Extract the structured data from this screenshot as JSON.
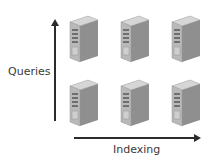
{
  "axes": {
    "y_label": "Queries",
    "x_label": "Indexing"
  },
  "servers": {
    "rows": 2,
    "columns": 3,
    "icon": "server-tower-icon",
    "positions": [
      {
        "x": 68,
        "y": 12
      },
      {
        "x": 119,
        "y": 12
      },
      {
        "x": 170,
        "y": 12
      },
      {
        "x": 68,
        "y": 76
      },
      {
        "x": 119,
        "y": 76
      },
      {
        "x": 170,
        "y": 76
      }
    ]
  },
  "colors": {
    "arrow": "#2b2b2b",
    "server_front": "#b9b9b9",
    "server_side": "#8f8f8f",
    "server_top": "#d6d6d6",
    "text": "#3a3a3a"
  }
}
